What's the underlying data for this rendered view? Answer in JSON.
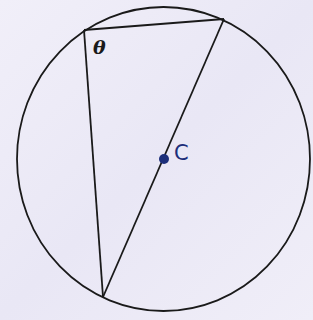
{
  "diagram": {
    "type": "circle-geometry",
    "circle": {
      "cx": 163.5,
      "cy": 159,
      "rx": 146.5,
      "ry": 152,
      "stroke": "#1a1a1a"
    },
    "vertices": {
      "top_left": {
        "x": 84,
        "y": 30
      },
      "top_right": {
        "x": 224,
        "y": 19
      },
      "bottom": {
        "x": 103,
        "y": 297
      }
    },
    "center": {
      "x": 164,
      "y": 159,
      "color": "#1c2e7a"
    },
    "labels": {
      "angle": "θ",
      "center": "C"
    },
    "colors": {
      "background": "#efedf8",
      "line": "#1a1a1a",
      "accent": "#1c2e7a"
    }
  }
}
